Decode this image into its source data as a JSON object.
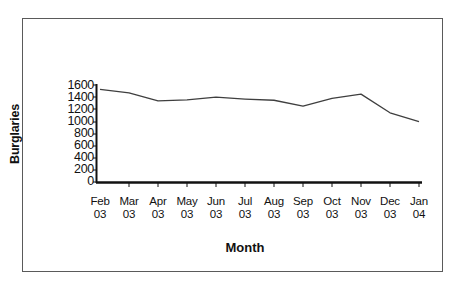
{
  "chart_data": {
    "type": "line",
    "title": "",
    "xlabel": "Month",
    "ylabel": "Burglaries",
    "categories": [
      "Feb 03",
      "Mar 03",
      "Apr 03",
      "May 03",
      "Jun 03",
      "Jul 03",
      "Aug 03",
      "Sep 03",
      "Oct 03",
      "Nov 03",
      "Dec 03",
      "Jan 04"
    ],
    "x_tick_labels": [
      {
        "month": "Feb",
        "year": "03"
      },
      {
        "month": "Mar",
        "year": "03"
      },
      {
        "month": "Apr",
        "year": "03"
      },
      {
        "month": "May",
        "year": "03"
      },
      {
        "month": "Jun",
        "year": "03"
      },
      {
        "month": "Jul",
        "year": "03"
      },
      {
        "month": "Aug",
        "year": "03"
      },
      {
        "month": "Sep",
        "year": "03"
      },
      {
        "month": "Oct",
        "year": "03"
      },
      {
        "month": "Nov",
        "year": "03"
      },
      {
        "month": "Dec",
        "year": "03"
      },
      {
        "month": "Jan",
        "year": "04"
      }
    ],
    "values": [
      1530,
      1470,
      1340,
      1355,
      1400,
      1370,
      1350,
      1255,
      1380,
      1450,
      1145,
      1000
    ],
    "y_tick_labels": [
      "1600",
      "1400",
      "1200",
      "1000",
      "800",
      "600",
      "400",
      "200",
      "0"
    ],
    "y_ticks": [
      1600,
      1400,
      1200,
      1000,
      800,
      600,
      400,
      200,
      0
    ],
    "ylim": [
      0,
      1600
    ],
    "grid": false,
    "legend": false,
    "line_color": "#3f3f3f",
    "axis_color": "#111111",
    "frame_color": "#5a5a5a",
    "background_color": "#ffffff"
  }
}
